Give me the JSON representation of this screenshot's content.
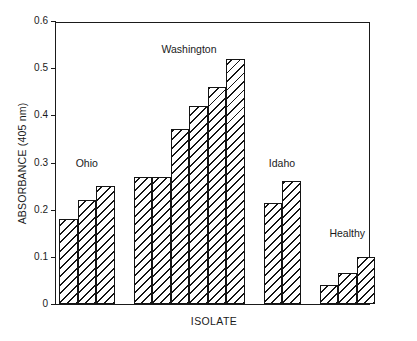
{
  "chart_data": {
    "type": "bar",
    "title": "",
    "xlabel": "ISOLATE",
    "ylabel": "ABSORBANCE (405 nm)",
    "ylim": [
      0,
      0.6
    ],
    "ytick_labels": [
      "0",
      "0.1",
      "0.2",
      "0.3",
      "0.4",
      "0.5",
      "0.6"
    ],
    "ytick_values": [
      0,
      0.1,
      0.2,
      0.3,
      0.4,
      0.5,
      0.6
    ],
    "grid": false,
    "legend": "none",
    "xtick_labels": [],
    "bar_style": "diagonal-hatch",
    "groups": [
      {
        "name": "Ohio",
        "values": [
          0.18,
          0.22,
          0.25
        ]
      },
      {
        "name": "Washington",
        "values": [
          0.27,
          0.27,
          0.37,
          0.42,
          0.46,
          0.52
        ]
      },
      {
        "name": "Idaho",
        "values": [
          0.215,
          0.26
        ]
      },
      {
        "name": "Healthy",
        "values": [
          0.04,
          0.065,
          0.1
        ]
      }
    ],
    "categories": [
      "Ohio-1",
      "Ohio-2",
      "Ohio-3",
      "Washington-1",
      "Washington-2",
      "Washington-3",
      "Washington-4",
      "Washington-5",
      "Washington-6",
      "Idaho-1",
      "Idaho-2",
      "Healthy-1",
      "Healthy-2",
      "Healthy-3"
    ],
    "values": [
      0.18,
      0.22,
      0.25,
      0.27,
      0.27,
      0.37,
      0.42,
      0.46,
      0.52,
      0.215,
      0.26,
      0.04,
      0.065,
      0.1
    ],
    "colors": {
      "axis": "#1a1a1a",
      "bar_edge": "#141414",
      "bar_fill": "#ffffff",
      "background": "#ffffff"
    }
  }
}
